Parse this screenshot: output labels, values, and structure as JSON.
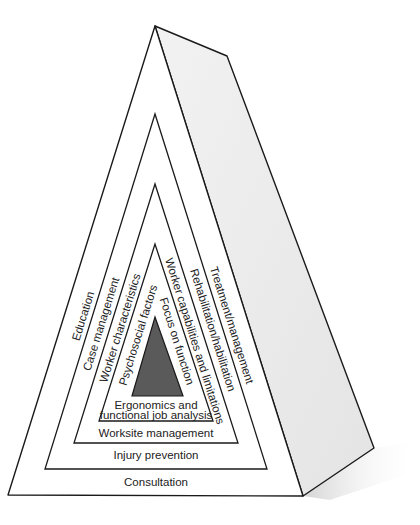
{
  "diagram": {
    "type": "nested-pyramid",
    "colors": {
      "line": "#1a1a1a",
      "front_face": "#ffffff",
      "side_face": "#ececec",
      "core": "#5a5a5a",
      "shadow": "#d8d8d8"
    },
    "layers": [
      {
        "level": 1,
        "bottom": "Consultation",
        "left": "Education",
        "right": "Treatment/management"
      },
      {
        "level": 2,
        "bottom": "Injury prevention",
        "left": "Case management",
        "right": "Rehabilitation/habilitation"
      },
      {
        "level": 3,
        "bottom": "Worksite management",
        "left": "Worker characteristics",
        "right": "Worker capabilities and limitations"
      },
      {
        "level": 4,
        "bottom_line1": "Ergonomics and",
        "bottom_line2": "functional job analysis",
        "left": "Psychosocial factors",
        "right": "Focus on function"
      }
    ]
  }
}
